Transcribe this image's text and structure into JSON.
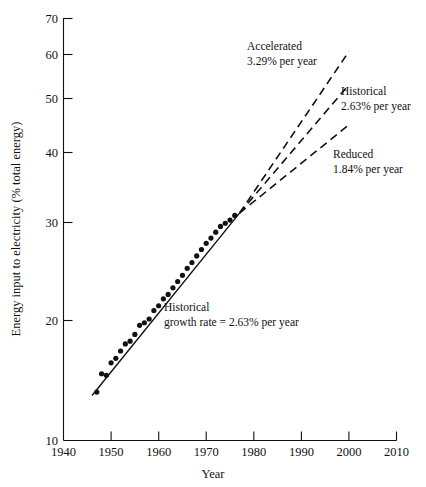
{
  "chart_data": {
    "type": "scatter",
    "title": "",
    "xlabel": "Year",
    "ylabel": "Energy input to electricity (% total energy)",
    "xlim": [
      1940,
      2010
    ],
    "ylim": [
      10,
      70
    ],
    "yscale": "log",
    "grid": false,
    "legend_position": "none",
    "xticks": [
      1940,
      1950,
      1960,
      1970,
      1980,
      1990,
      2000,
      2010
    ],
    "xticklabels": [
      "1940",
      "1950",
      "1960",
      "1970",
      "1980",
      "1990",
      "2000",
      "2010"
    ],
    "yticks": [
      10,
      20,
      30,
      40,
      50,
      60,
      70
    ],
    "yticklabels": [
      "10",
      "20",
      "30",
      "40",
      "50",
      "60",
      "70"
    ],
    "series": [
      {
        "name": "Observed energy input to electricity",
        "type": "scatter",
        "marker": "filled-circle",
        "x": [
          1947,
          1948,
          1949,
          1950,
          1951,
          1952,
          1953,
          1954,
          1955,
          1956,
          1957,
          1958,
          1959,
          1960,
          1961,
          1962,
          1963,
          1964,
          1965,
          1966,
          1967,
          1968,
          1969,
          1970,
          1971,
          1972,
          1973,
          1974,
          1975,
          1976
        ],
        "y": [
          12.5,
          13.6,
          13.5,
          14.3,
          14.6,
          15.1,
          15.6,
          15.8,
          16.3,
          17.0,
          17.2,
          17.5,
          18.2,
          18.6,
          19.2,
          19.6,
          20.2,
          20.8,
          21.4,
          22.1,
          22.7,
          23.4,
          24.1,
          24.8,
          25.4,
          26.1,
          26.8,
          27.2,
          27.6,
          28.2
        ]
      },
      {
        "name": "Historical trend fit",
        "type": "line",
        "x": [
          1946,
          1977
        ],
        "y": [
          12.3,
          28.5
        ]
      },
      {
        "name": "Accelerated",
        "type": "line",
        "style": "dashed",
        "x": [
          1977,
          2000
        ],
        "y": [
          28.5,
          60.0
        ]
      },
      {
        "name": "Historical",
        "type": "line",
        "style": "dashed",
        "x": [
          1977,
          2000
        ],
        "y": [
          28.5,
          51.5
        ]
      },
      {
        "name": "Reduced",
        "type": "line",
        "style": "dashed",
        "x": [
          1977,
          2000
        ],
        "y": [
          28.5,
          42.8
        ]
      }
    ],
    "annotations": [
      {
        "id": "accelerated",
        "name": "Accelerated",
        "rate": "3.29% per year",
        "line1": "Accelerated",
        "line2": "3.29% per year"
      },
      {
        "id": "historical",
        "name": "Historical",
        "rate": "2.63% per year",
        "line1": "Historical",
        "line2": "2.63% per year"
      },
      {
        "id": "reduced",
        "name": "Reduced",
        "rate": "1.84% per year",
        "line1": "Reduced",
        "line2": "1.84% per year"
      },
      {
        "id": "historical-growth",
        "line1": "Historical",
        "line2": "growth rate = 2.63% per year"
      }
    ]
  },
  "axes": {
    "x_title": "Year",
    "y_title": "Energy input to electricity (% total energy)",
    "x_ticks": [
      "1940",
      "1950",
      "1960",
      "1970",
      "1980",
      "1990",
      "2000",
      "2010"
    ],
    "y_ticks": [
      "70",
      "60",
      "50",
      "40",
      "30",
      "20",
      "10"
    ]
  },
  "annotations": {
    "accelerated_line1": "Accelerated",
    "accelerated_line2": "3.29% per year",
    "historical_line1": "Historical",
    "historical_line2": "2.63% per year",
    "reduced_line1": "Reduced",
    "reduced_line2": "1.84% per year",
    "inplot_line1": "Historical",
    "inplot_line2": "growth rate = 2.63% per year"
  },
  "colors": {
    "ink": "#111111",
    "background": "#ffffff"
  }
}
